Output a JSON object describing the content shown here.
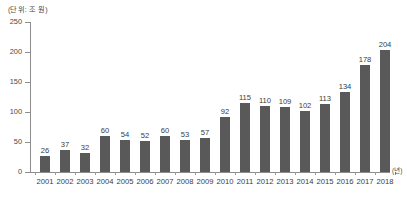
{
  "chart_data": {
    "type": "bar",
    "title": "",
    "unit_caption": "(단위: 조 원)",
    "xlabel": "(년)",
    "ylabel": "",
    "ylim": [
      0,
      250
    ],
    "ytick_labels": [
      "0",
      "50",
      "100",
      "150",
      "200",
      "250"
    ],
    "ytick_values": [
      0,
      50,
      100,
      150,
      200,
      250
    ],
    "grid": false,
    "legend": null,
    "bar_color": "#595959",
    "background_color": "#ffffff",
    "axis_color": "#8d8d8d",
    "categories": [
      "2001",
      "2002",
      "2003",
      "2004",
      "2005",
      "2006",
      "2007",
      "2008",
      "2009",
      "2010",
      "2011",
      "2012",
      "2013",
      "2014",
      "2015",
      "2016",
      "2017",
      "2018"
    ],
    "values": [
      26,
      37,
      32,
      60,
      54,
      52,
      60,
      53,
      57,
      92,
      115,
      110,
      109,
      102,
      113,
      134,
      178,
      204
    ],
    "data_labels": [
      "26",
      "37",
      "32",
      "60",
      "54",
      "52",
      "60",
      "53",
      "57",
      "92",
      "115",
      "110",
      "109",
      "102",
      "113",
      "134",
      "178",
      "204"
    ]
  }
}
